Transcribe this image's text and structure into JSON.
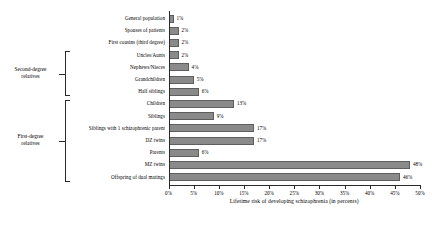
{
  "chart_data": {
    "type": "bar",
    "orientation": "horizontal",
    "title": "",
    "xlabel": "Lifetime risk of developing schizophrenia (in percents)",
    "ylabel": "",
    "xlim": [
      0,
      50
    ],
    "grid": false,
    "legend": null,
    "bar_color": "#8a8a8a",
    "axis_color": "#2a2a2a",
    "xticks": [
      "0%",
      "5%",
      "10%",
      "15%",
      "20%",
      "25%",
      "30%",
      "35%",
      "40%",
      "45%",
      "50%"
    ],
    "xtick_values": [
      0,
      5,
      10,
      15,
      20,
      25,
      30,
      35,
      40,
      45,
      50
    ],
    "categories": [
      "General population",
      "Spouses of patients",
      "First cousins (third degree)",
      "Uncles/Aunts",
      "Nephews/Nieces",
      "Grandchildren",
      "Half siblings",
      "Children",
      "Siblings",
      "Siblings with 1 schizophrenic parent",
      "DZ twins",
      "Parents",
      "MZ twins",
      "Offspring of dual matings"
    ],
    "values": [
      1,
      2,
      2,
      2,
      4,
      5,
      6,
      13,
      9,
      17,
      17,
      6,
      48,
      46
    ],
    "value_labels": [
      "1%",
      "2%",
      "2%",
      "2%",
      "4%",
      "5%",
      "6%",
      "13%",
      "9%",
      "17%",
      "17%",
      "6%",
      "48%",
      "46%"
    ],
    "groups": [
      {
        "label_line1": "Second-degree",
        "label_line2": "relatives",
        "first_index": 3,
        "last_index": 6
      },
      {
        "label_line1": "First-degree",
        "label_line2": "relatives",
        "first_index": 7,
        "last_index": 13
      }
    ]
  }
}
